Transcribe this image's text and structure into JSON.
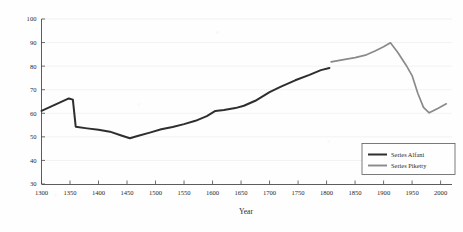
{
  "chart_data": {
    "type": "line",
    "title": "",
    "xlabel": "Year",
    "ylabel": "",
    "xlim": [
      1300,
      2020
    ],
    "ylim": [
      30,
      100
    ],
    "grid": true,
    "legend_position": "bottom-right",
    "xticks": [
      1300,
      1350,
      1400,
      1450,
      1500,
      1550,
      1600,
      1650,
      1700,
      1750,
      1800,
      1850,
      1900,
      1950,
      2000
    ],
    "yticks": [
      30,
      40,
      50,
      60,
      70,
      80,
      90,
      100
    ],
    "series": [
      {
        "name": "Series Alfani",
        "color": "#2e2e2e",
        "x": [
          1300,
          1348,
          1355,
          1360,
          1380,
          1400,
          1420,
          1440,
          1455,
          1470,
          1490,
          1510,
          1530,
          1550,
          1570,
          1590,
          1605,
          1620,
          1640,
          1655,
          1675,
          1700,
          1720,
          1745,
          1770,
          1790,
          1805
        ],
        "y": [
          61.0,
          66.3,
          65.8,
          54.3,
          53.6,
          53.0,
          52.2,
          50.6,
          49.4,
          50.5,
          51.8,
          53.2,
          54.2,
          55.4,
          56.8,
          58.8,
          61.0,
          61.4,
          62.2,
          63.2,
          65.3,
          69.0,
          71.3,
          74.0,
          76.3,
          78.3,
          79.2
        ]
      },
      {
        "name": "Series Piketty",
        "color": "#8a8a8a",
        "x": [
          1808,
          1830,
          1850,
          1870,
          1885,
          1900,
          1912,
          1925,
          1940,
          1950,
          1960,
          1970,
          1980,
          1995,
          2010
        ],
        "y": [
          81.8,
          82.8,
          83.6,
          84.8,
          86.4,
          88.2,
          89.9,
          85.8,
          80.2,
          76.0,
          68.5,
          62.5,
          60.2,
          62.0,
          64.0
        ]
      }
    ]
  },
  "legend": {
    "items": [
      {
        "label": "Series Alfani"
      },
      {
        "label": "Series Piketty"
      }
    ]
  },
  "axes": {
    "x_title": "Year"
  }
}
